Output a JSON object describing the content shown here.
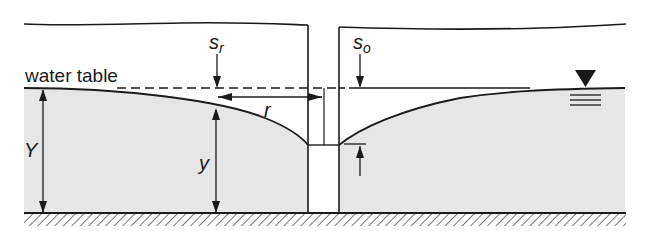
{
  "diagram": {
    "labels": {
      "water_table": "water table",
      "s_r": "s",
      "s_r_sub": "r",
      "s_o": "s",
      "s_o_sub": "o",
      "r": "r",
      "Y": "Y",
      "y": "y"
    },
    "colors": {
      "aquifer_fill": "#e6e6e6",
      "line": "#1a1a1a",
      "background": "#ffffff"
    },
    "symbols": {
      "water_surface": "inverted-triangle-water-level-symbol",
      "ground_base": "hatched-impermeable-base"
    }
  }
}
